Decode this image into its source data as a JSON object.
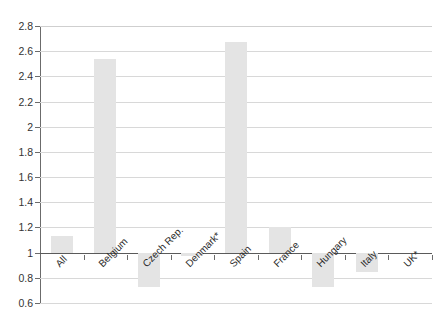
{
  "chart_data": {
    "type": "bar",
    "title": "",
    "subtitle": "",
    "xlabel": "",
    "ylabel": "",
    "categories": [
      "All",
      "Belgium",
      "Czech Rep.",
      "Denmark*",
      "Spain",
      "France",
      "Hungary",
      "Italy",
      "UK*"
    ],
    "values": [
      1.13,
      2.54,
      0.73,
      0.97,
      2.67,
      1.2,
      0.73,
      0.85,
      1.0
    ],
    "baseline": 1.0,
    "ylim": [
      0.6,
      2.8
    ],
    "ytick_step": 0.2,
    "ytick_labels": [
      "2.8",
      "2.6",
      "2.4",
      "2.2",
      "2",
      "1.8",
      "1.6",
      "1.4",
      "1.2",
      "1",
      "0.8",
      "0.6"
    ],
    "ytick_values": [
      2.8,
      2.6,
      2.4,
      2.2,
      2.0,
      1.8,
      1.6,
      1.4,
      1.2,
      1.0,
      0.8,
      0.6
    ],
    "grid": true,
    "legend": "none",
    "bar_color": "#e4e4e4",
    "grid_color": "#d8d8d8",
    "axis_color": "#6b6b6b",
    "text_color": "#2b2b2b",
    "background": "#ffffff",
    "xlabel_rotation": -45
  }
}
